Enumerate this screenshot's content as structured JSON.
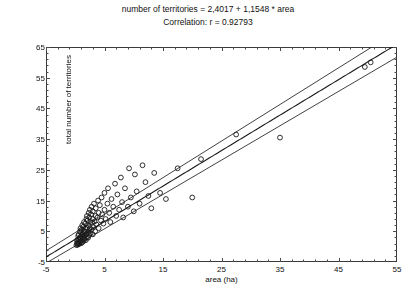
{
  "title": {
    "equation": "number of territories = 2,4017 + 1,1548 * area",
    "correlation": "Correlation: r = 0.92793"
  },
  "axes": {
    "xlabel": "area (ha)",
    "ylabel": "total number of territories",
    "xticks": [
      -5,
      5,
      15,
      25,
      35,
      45,
      55
    ],
    "yticks": [
      -5,
      5,
      15,
      25,
      35,
      45,
      55,
      65
    ],
    "xlim": [
      -5,
      55
    ],
    "ylim": [
      -5,
      65
    ],
    "minor_tick_step": 2
  },
  "chart_data": {
    "type": "scatter",
    "title": "number of territories = 2,4017 + 1,1548 * area",
    "subtitle": "Correlation: r = 0.92793",
    "xlabel": "area (ha)",
    "ylabel": "total number of territories",
    "xlim": [
      -5,
      55
    ],
    "ylim": [
      -5,
      65
    ],
    "grid": false,
    "legend": null,
    "marker": "open-circle",
    "regression": {
      "intercept": 2.4017,
      "slope": 1.1548,
      "r": 0.92793,
      "bands": [
        "lower-confidence",
        "fit",
        "upper-confidence"
      ],
      "band_offset_at_xmin": 2.0,
      "band_offset_at_xmax": 4.2
    },
    "points": [
      [
        0.2,
        0.5
      ],
      [
        0.3,
        1.0
      ],
      [
        0.3,
        2.0
      ],
      [
        0.4,
        0.6
      ],
      [
        0.4,
        1.5
      ],
      [
        0.5,
        0.8
      ],
      [
        0.5,
        2.5
      ],
      [
        0.5,
        3.5
      ],
      [
        0.6,
        1.2
      ],
      [
        0.6,
        4.0
      ],
      [
        0.7,
        0.9
      ],
      [
        0.7,
        2.2
      ],
      [
        0.8,
        1.6
      ],
      [
        0.8,
        3.0
      ],
      [
        0.8,
        5.0
      ],
      [
        0.9,
        2.8
      ],
      [
        0.9,
        6.0
      ],
      [
        1.0,
        1.1
      ],
      [
        1.0,
        3.4
      ],
      [
        1.0,
        4.6
      ],
      [
        1.1,
        2.0
      ],
      [
        1.1,
        5.5
      ],
      [
        1.2,
        1.4
      ],
      [
        1.2,
        3.8
      ],
      [
        1.2,
        7.0
      ],
      [
        1.3,
        2.6
      ],
      [
        1.3,
        4.2
      ],
      [
        1.4,
        1.8
      ],
      [
        1.4,
        6.5
      ],
      [
        1.5,
        3.2
      ],
      [
        1.5,
        5.0
      ],
      [
        1.5,
        8.0
      ],
      [
        1.6,
        2.4
      ],
      [
        1.6,
        4.8
      ],
      [
        1.7,
        3.6
      ],
      [
        1.7,
        7.5
      ],
      [
        1.8,
        2.1
      ],
      [
        1.8,
        5.8
      ],
      [
        1.9,
        4.0
      ],
      [
        1.9,
        9.0
      ],
      [
        2.0,
        3.0
      ],
      [
        2.0,
        6.2
      ],
      [
        2.0,
        10.0
      ],
      [
        2.1,
        4.5
      ],
      [
        2.1,
        8.5
      ],
      [
        2.2,
        2.9
      ],
      [
        2.2,
        7.0
      ],
      [
        2.3,
        5.2
      ],
      [
        2.3,
        11.0
      ],
      [
        2.4,
        3.8
      ],
      [
        2.4,
        9.5
      ],
      [
        2.5,
        6.0
      ],
      [
        2.5,
        12.0
      ],
      [
        2.6,
        4.4
      ],
      [
        2.6,
        8.0
      ],
      [
        2.7,
        10.5
      ],
      [
        2.8,
        5.6
      ],
      [
        2.8,
        13.0
      ],
      [
        2.9,
        7.8
      ],
      [
        3.0,
        4.0
      ],
      [
        3.0,
        9.0
      ],
      [
        3.0,
        11.5
      ],
      [
        3.1,
        6.4
      ],
      [
        3.2,
        14.0
      ],
      [
        3.3,
        8.2
      ],
      [
        3.4,
        5.0
      ],
      [
        3.5,
        10.0
      ],
      [
        3.5,
        12.5
      ],
      [
        3.6,
        7.2
      ],
      [
        3.8,
        9.5
      ],
      [
        3.9,
        15.0
      ],
      [
        4.0,
        6.0
      ],
      [
        4.0,
        11.0
      ],
      [
        4.2,
        13.5
      ],
      [
        4.4,
        8.5
      ],
      [
        4.5,
        16.0
      ],
      [
        4.6,
        10.5
      ],
      [
        4.8,
        7.5
      ],
      [
        5.0,
        12.0
      ],
      [
        5.0,
        17.5
      ],
      [
        5.2,
        9.0
      ],
      [
        5.5,
        14.0
      ],
      [
        5.6,
        19.0
      ],
      [
        5.8,
        11.0
      ],
      [
        6.0,
        8.0
      ],
      [
        6.2,
        15.5
      ],
      [
        6.5,
        13.0
      ],
      [
        6.8,
        20.5
      ],
      [
        7.0,
        10.0
      ],
      [
        7.2,
        17.0
      ],
      [
        7.5,
        12.0
      ],
      [
        7.8,
        22.5
      ],
      [
        8.0,
        14.5
      ],
      [
        8.2,
        9.5
      ],
      [
        8.5,
        19.0
      ],
      [
        9.0,
        13.0
      ],
      [
        9.2,
        25.5
      ],
      [
        9.5,
        16.0
      ],
      [
        10.0,
        11.5
      ],
      [
        10.2,
        23.5
      ],
      [
        10.5,
        18.0
      ],
      [
        11.0,
        14.0
      ],
      [
        11.5,
        26.5
      ],
      [
        12.0,
        21.0
      ],
      [
        12.5,
        16.5
      ],
      [
        13.0,
        12.5
      ],
      [
        13.5,
        24.0
      ],
      [
        14.5,
        17.5
      ],
      [
        15.5,
        15.5
      ],
      [
        17.5,
        25.5
      ],
      [
        20.0,
        16.0
      ],
      [
        21.5,
        28.5
      ],
      [
        27.5,
        36.5
      ],
      [
        35.0,
        35.5
      ],
      [
        49.5,
        58.5
      ],
      [
        50.5,
        60.0
      ]
    ]
  }
}
